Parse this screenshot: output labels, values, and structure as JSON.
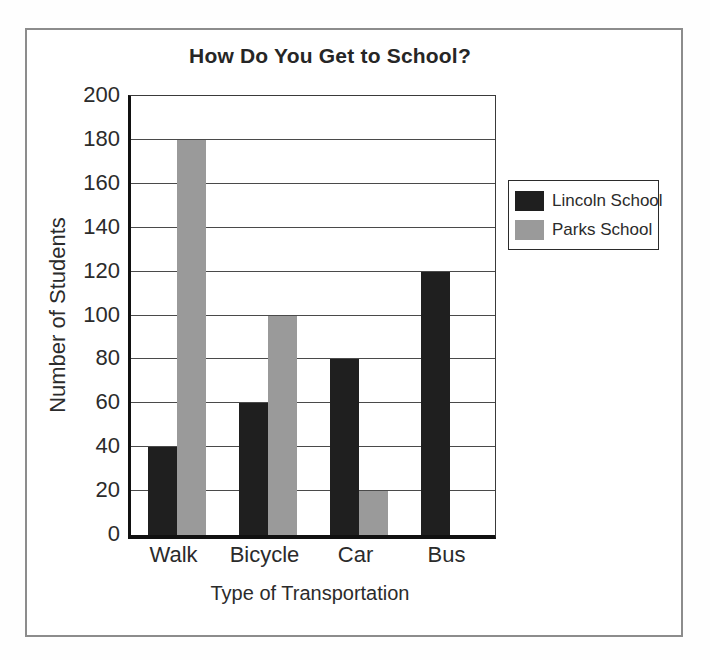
{
  "page": {
    "background": "#ffffff",
    "frame_border_color": "#8c8c8c"
  },
  "chart_data": {
    "type": "bar",
    "title": "How Do You Get to School?",
    "xlabel": "Type of Transportation",
    "ylabel": "Number of Students",
    "categories": [
      "Walk",
      "Bicycle",
      "Car",
      "Bus"
    ],
    "series": [
      {
        "name": "Lincoln School",
        "color": "#1f1f1f",
        "values": [
          40,
          60,
          80,
          120
        ]
      },
      {
        "name": "Parks School",
        "color": "#9a9a9a",
        "values": [
          180,
          100,
          20,
          0
        ]
      }
    ],
    "ylim": [
      0,
      200
    ],
    "yticks": [
      0,
      20,
      40,
      60,
      80,
      100,
      120,
      140,
      160,
      180,
      200
    ],
    "grid": true,
    "gridline_color": "#4a4a4a",
    "axis_color": "#111111",
    "legend_position": "right"
  }
}
